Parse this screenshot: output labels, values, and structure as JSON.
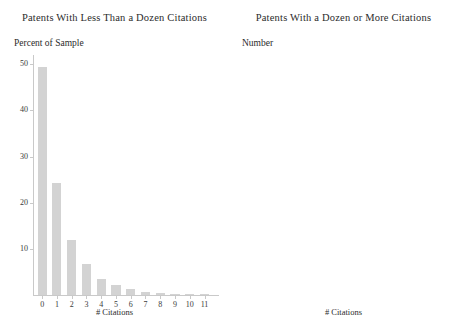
{
  "figure": {
    "background": "#ffffff",
    "bar_color": "#d3d3d3",
    "axis_color": "#c9c9c9",
    "text_color": "#2b2b2b"
  },
  "panels": [
    {
      "title": "Patents With Less Than a Dozen Citations",
      "ylabel": "Percent of Sample",
      "xlabel": "# Citations"
    },
    {
      "title": "Patents With a Dozen or More Citations",
      "ylabel": "Number",
      "xlabel": "# Citations"
    }
  ],
  "chart_data": [
    {
      "type": "bar",
      "title": "Patents With Less Than a Dozen Citations",
      "xlabel": "# Citations",
      "ylabel": "Percent of Sample",
      "categories": [
        "0",
        "1",
        "2",
        "3",
        "4",
        "5",
        "6",
        "7",
        "8",
        "9",
        "10",
        "11"
      ],
      "values": [
        49.3,
        24.2,
        11.9,
        6.7,
        3.5,
        2.2,
        1.2,
        0.6,
        0.35,
        0.25,
        0.2,
        0.15
      ],
      "ylim": [
        0,
        52
      ],
      "yticks": [
        10,
        20,
        30,
        40,
        50
      ],
      "ytick_labels": [
        "10",
        "20",
        "30",
        "40",
        "50"
      ],
      "xticks": [
        0,
        1,
        2,
        3,
        4,
        5,
        6,
        7,
        8,
        9,
        10,
        11
      ],
      "xtick_labels": [
        "0",
        "1",
        "2",
        "3",
        "4",
        "5",
        "6",
        "7",
        "8",
        "9",
        "10",
        "11"
      ],
      "grid": false,
      "legend": "none"
    },
    {
      "type": "bar",
      "title": "Patents With a Dozen or More Citations",
      "xlabel": "# Citations",
      "ylabel": "Number",
      "categories": [
        "12",
        "13",
        "14",
        "15",
        "16",
        "17",
        "18",
        "19",
        "20",
        "21",
        "22",
        "23",
        "24",
        "25",
        "26",
        "27",
        "28",
        "29",
        "30",
        "31",
        "32",
        "33",
        "34",
        "35",
        "36",
        "37",
        "38",
        "39",
        "40",
        "41",
        "42",
        "43",
        "44",
        "45",
        "46",
        "47",
        "48",
        "49",
        "50"
      ],
      "values": [
        712,
        500,
        400,
        395,
        330,
        290,
        250,
        215,
        200,
        175,
        150,
        130,
        120,
        105,
        95,
        85,
        75,
        68,
        60,
        52,
        48,
        44,
        40,
        35,
        30,
        28,
        25,
        22,
        20,
        18,
        17,
        15,
        14,
        12,
        11,
        10,
        9,
        8,
        7
      ],
      "ylim": [
        0,
        840
      ],
      "yticks": [
        200,
        400,
        600,
        800
      ],
      "ytick_labels": [
        "200",
        "400",
        "600",
        "800"
      ],
      "xticks": [
        10,
        20,
        30,
        40,
        50
      ],
      "xtick_labels": [
        "10",
        "20",
        "30",
        "40",
        "50"
      ],
      "grid": false,
      "legend": "none"
    }
  ]
}
